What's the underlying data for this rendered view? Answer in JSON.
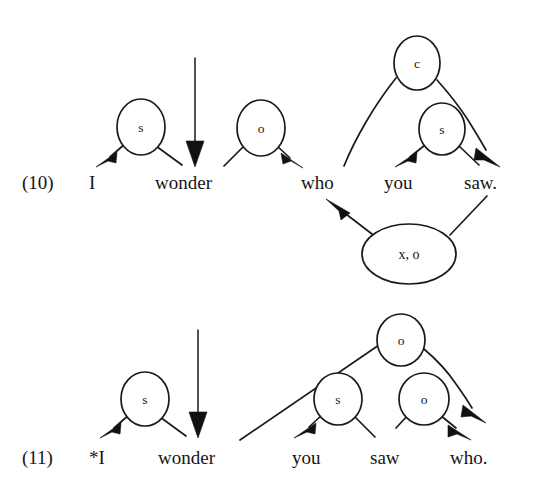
{
  "figure": {
    "kind": "dependency-diagram",
    "background_color": "#ffffff",
    "ink_color": "#151515",
    "examples": [
      {
        "id": "ex10",
        "number": "(10)",
        "words": [
          {
            "id": "w10-i",
            "text": "I"
          },
          {
            "id": "w10-wonder",
            "text": "wonder"
          },
          {
            "id": "w10-who",
            "text": "who"
          },
          {
            "id": "w10-you",
            "text": "you"
          },
          {
            "id": "w10-saw",
            "text": "saw."
          }
        ],
        "nodes": [
          {
            "id": "n10-s1",
            "label": "s",
            "shape": "circle"
          },
          {
            "id": "n10-o1",
            "label": "o",
            "shape": "circle"
          },
          {
            "id": "n10-c",
            "label": "c",
            "shape": "circle"
          },
          {
            "id": "n10-s2",
            "label": "s",
            "shape": "circle"
          },
          {
            "id": "n10-xo",
            "label": "x, o",
            "shape": "ellipse"
          }
        ]
      },
      {
        "id": "ex11",
        "number": "(11)",
        "words": [
          {
            "id": "w11-i",
            "text": "*I"
          },
          {
            "id": "w11-wonder",
            "text": "wonder"
          },
          {
            "id": "w11-you",
            "text": "you"
          },
          {
            "id": "w11-saw",
            "text": "saw"
          },
          {
            "id": "w11-who",
            "text": "who."
          }
        ],
        "nodes": [
          {
            "id": "n11-s1",
            "label": "s",
            "shape": "circle"
          },
          {
            "id": "n11-o-top",
            "label": "o",
            "shape": "circle"
          },
          {
            "id": "n11-s2",
            "label": "s",
            "shape": "circle"
          },
          {
            "id": "n11-o2",
            "label": "o",
            "shape": "circle"
          }
        ]
      }
    ]
  }
}
